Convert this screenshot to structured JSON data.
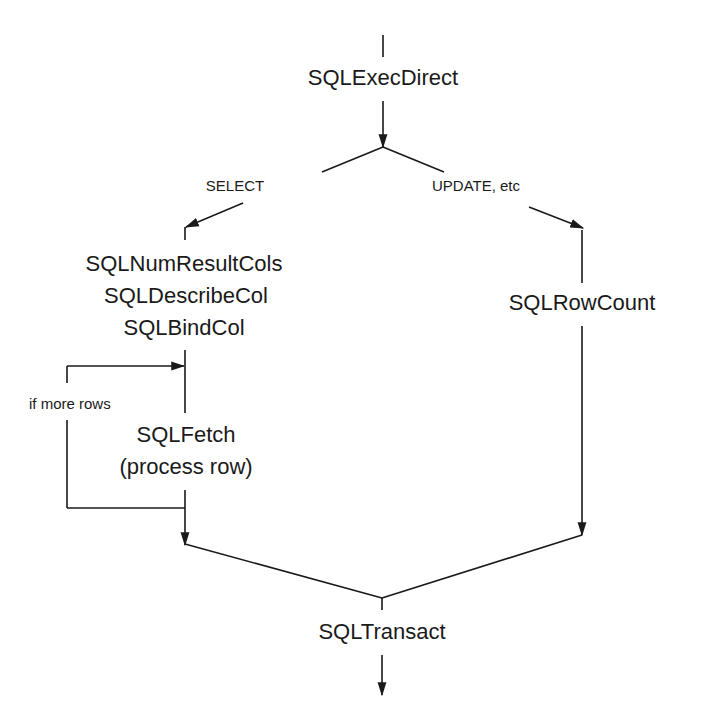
{
  "diagram": {
    "nodes": {
      "exec_direct": "SQLExecDirect",
      "num_result_cols": "SQLNumResultCols",
      "describe_col": "SQLDescribeCol",
      "bind_col": "SQLBindCol",
      "fetch": "SQLFetch",
      "process_row": "(process row)",
      "row_count": "SQLRowCount",
      "transact": "SQLTransact"
    },
    "edge_labels": {
      "select": "SELECT",
      "update": "UPDATE, etc",
      "loop": "if more rows"
    },
    "colors": {
      "line": "#1a1a1a",
      "background": "#ffffff"
    }
  }
}
